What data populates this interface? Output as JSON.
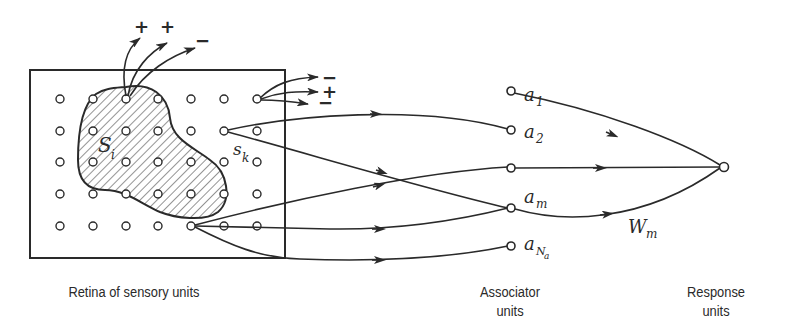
{
  "diagram": {
    "retina": {
      "caption": "Retina of sensory units",
      "region_label": "S",
      "region_label_sub": "i",
      "unit_label": "s",
      "unit_label_sub": "k",
      "grid_columns": 7,
      "grid_rows": 5,
      "top_signs": [
        "+",
        "+",
        "−"
      ],
      "right_signs": [
        "−",
        "+",
        "−"
      ]
    },
    "associators": {
      "caption_line1": "Associator",
      "caption_line2": "units",
      "units": [
        {
          "label": "a",
          "sub": "1"
        },
        {
          "label": "a",
          "sub": "2"
        },
        {
          "label": "",
          "sub": ""
        },
        {
          "label": "a",
          "sub": "m"
        },
        {
          "label": "a",
          "sub": "N",
          "subsub": "a"
        }
      ]
    },
    "response": {
      "caption_line1": "Response",
      "caption_line2": "units",
      "weight_label": "W",
      "weight_sub": "m"
    },
    "colors": {
      "ink": "#2a2a2a",
      "background": "#ffffff"
    }
  }
}
